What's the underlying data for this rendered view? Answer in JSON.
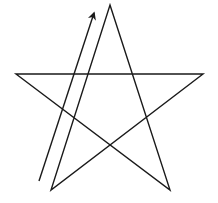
{
  "diagram": {
    "background": "#ffffff",
    "stroke_color": "#1a1a1a",
    "stroke_width": 1.4,
    "star": {
      "points": [
        [
          110,
          5
        ],
        [
          170,
          190
        ],
        [
          16,
          74
        ],
        [
          203,
          74
        ],
        [
          51,
          190
        ]
      ],
      "vertices": {
        "top": [
          110,
          5
        ],
        "left": [
          16,
          74
        ],
        "right": [
          203,
          74
        ],
        "bottom_left": [
          51,
          190
        ],
        "bottom_right": [
          170,
          190
        ]
      }
    },
    "arrow": {
      "from": [
        39,
        181
      ],
      "to": [
        94,
        13
      ],
      "head": "filled-triangle"
    }
  }
}
